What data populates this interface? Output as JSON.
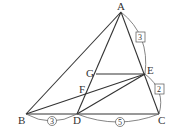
{
  "diagram": {
    "points": {
      "A": {
        "label": "A",
        "x": 121,
        "y": 12
      },
      "B": {
        "label": "B",
        "x": 26,
        "y": 114
      },
      "C": {
        "label": "C",
        "x": 159,
        "y": 114
      },
      "D": {
        "label": "D",
        "x": 77,
        "y": 114
      },
      "E": {
        "label": "E",
        "x": 145,
        "y": 74
      },
      "F": {
        "label": "F",
        "x": 85,
        "y": 94
      },
      "G": {
        "label": "G",
        "x": 96,
        "y": 74
      }
    },
    "ratios": {
      "AE": "3",
      "EC": "2",
      "BD": "3",
      "DC": "5"
    },
    "colors": {
      "stroke": "#333333",
      "arc": "#555555"
    }
  }
}
